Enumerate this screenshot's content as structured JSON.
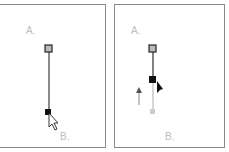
{
  "panels": [
    {
      "label_a": "A.",
      "label_b": "B."
    },
    {
      "label_a": "A.",
      "label_b": "B."
    }
  ],
  "colors": {
    "border": "#8a8a8a",
    "label": "#bdbdbd",
    "line": "#666666",
    "faded": "#c8c8c8",
    "anchor": "#111111"
  }
}
